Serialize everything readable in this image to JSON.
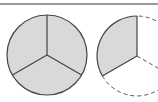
{
  "diagram": {
    "colors": {
      "fill": "#d9d9d9",
      "stroke": "#444444",
      "rule": "#9a9a9a"
    },
    "figures": [
      {
        "name": "whole-circle",
        "parts": 3,
        "shaded_parts": 3,
        "fraction": "3/3"
      },
      {
        "name": "partial-circle",
        "parts": 3,
        "shaded_parts": 2,
        "fraction": "2/3",
        "unshaded_outline": "dashed"
      }
    ]
  }
}
